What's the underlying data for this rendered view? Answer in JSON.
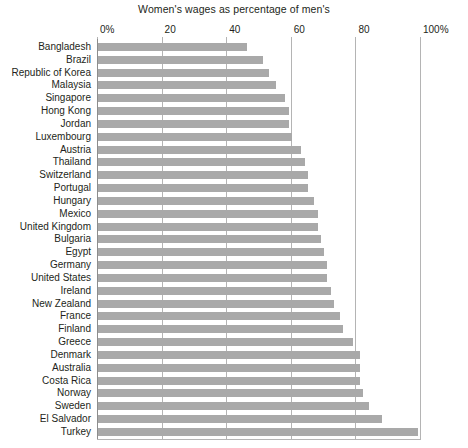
{
  "chart_data": {
    "type": "bar",
    "orientation": "horizontal",
    "title": "Women's wages as percentage of men's",
    "xlabel": "",
    "ylabel": "",
    "xlim": [
      0,
      100
    ],
    "grid": true,
    "legend": "none",
    "xticks": [
      0,
      20,
      40,
      60,
      80,
      100
    ],
    "xtick_labels": [
      "0%",
      "20",
      "40",
      "60",
      "80",
      "100%"
    ],
    "categories": [
      "Bangladesh",
      "Brazil",
      "Republic of Korea",
      "Malaysia",
      "Singapore",
      "Hong Kong",
      "Jordan",
      "Luxembourg",
      "Austria",
      "Thailand",
      "Switzerland",
      "Portugal",
      "Hungary",
      "Mexico",
      "United Kingdom",
      "Bulgaria",
      "Egypt",
      "Germany",
      "United States",
      "Ireland",
      "New Zealand",
      "France",
      "Finland",
      "Greece",
      "Denmark",
      "Australia",
      "Costa Rica",
      "Norway",
      "Sweden",
      "El Salvador",
      "Turkey"
    ],
    "values": [
      46,
      51,
      53,
      55,
      58,
      59,
      59,
      60,
      63,
      64,
      65,
      65,
      67,
      68,
      68,
      69,
      70,
      71,
      71,
      72,
      73,
      75,
      76,
      79,
      81,
      81,
      81,
      82,
      84,
      88,
      99
    ],
    "series_color": "#a9a9a9",
    "gridline_color": "#b4b4b4"
  }
}
